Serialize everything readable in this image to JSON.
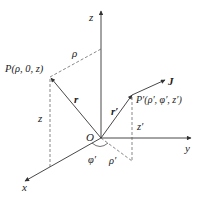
{
  "diagram": {
    "type": "3d-coordinate-system",
    "colors": {
      "line": "#333333",
      "text": "#222222",
      "background": "#ffffff"
    },
    "axes": {
      "z_label": "z",
      "y_label": "y",
      "x_label": "x"
    },
    "origin_label": "O",
    "point_p": {
      "label": "P(ρ, 0, z)"
    },
    "point_p_prime": {
      "label": "P′(ρ′, φ′, z′)"
    },
    "vectors": {
      "r": "r",
      "r_prime": "r′",
      "J": "J"
    },
    "dimensions": {
      "rho": "ρ",
      "z": "z",
      "z_prime": "z′",
      "rho_prime": "ρ′",
      "phi_prime": "φ′"
    }
  }
}
